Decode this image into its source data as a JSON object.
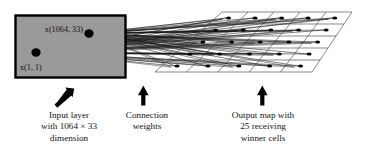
{
  "figure": {
    "kind": "neural-network-som-diagram",
    "background_color": "#ffffff",
    "ink_color": "#000000",
    "input_box_fill": "#9a9a9a",
    "input_box_stroke": "#000000"
  },
  "input_layer": {
    "node_top_label": "x(1064, 33)",
    "node_bottom_label": "x(1, 1)"
  },
  "output_map": {
    "rows": 5,
    "cols": 5,
    "cell_count": 25
  },
  "arrows": [
    {
      "name": "arrow-input-layer",
      "direction": "up-right"
    },
    {
      "name": "arrow-connection-weights",
      "direction": "up"
    },
    {
      "name": "arrow-output-map",
      "direction": "up"
    }
  ],
  "captions": {
    "input": "Input layer\nwith 1064 × 33\ndimension",
    "weights": "Connection\nweights",
    "output": "Output map with\n25 receiving\nwinner cells"
  }
}
